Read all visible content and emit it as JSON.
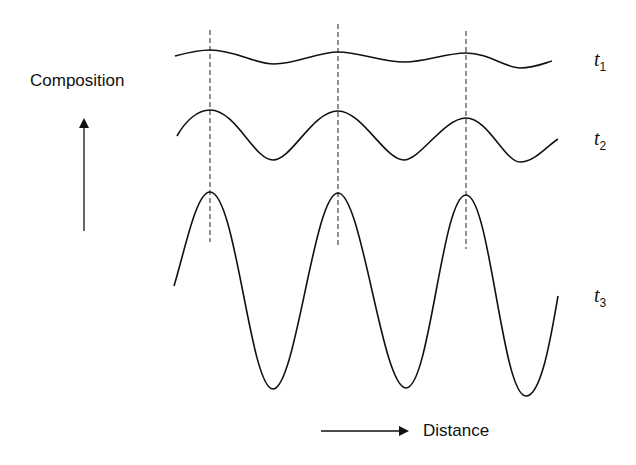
{
  "diagram": {
    "y_axis_label": "Composition",
    "x_axis_label": "Distance",
    "curves": [
      {
        "label": "t",
        "subscript": "1",
        "description": "small-amplitude composition fluctuation"
      },
      {
        "label": "t",
        "subscript": "2",
        "description": "medium-amplitude composition fluctuation"
      },
      {
        "label": "t",
        "subscript": "3",
        "description": "large-amplitude composition fluctuation"
      }
    ],
    "peak_markers": "dashed vertical lines through aligned peaks",
    "colors": {
      "line": "#111111",
      "background": "#ffffff"
    }
  }
}
